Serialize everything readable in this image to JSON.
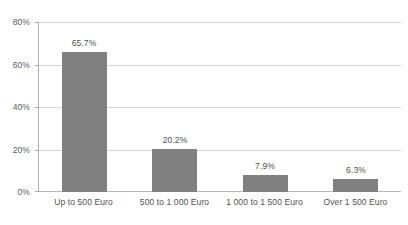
{
  "chart_data": {
    "type": "bar",
    "title": "",
    "xlabel": "",
    "ylabel": "",
    "categories": [
      "Up to 500 Euro",
      "500 to 1 000 Euro",
      "1 000 to 1 500 Euro",
      "Over 1 500 Euro"
    ],
    "values": [
      65.7,
      20.2,
      7.9,
      6.3
    ],
    "value_labels": [
      "65.7%",
      "20.2%",
      "7.9%",
      "6.3%"
    ],
    "ylim": [
      0,
      80
    ],
    "ytick_values": [
      0,
      20,
      40,
      60,
      80
    ],
    "ytick_labels": [
      "0%",
      "20%",
      "40%",
      "60%",
      "80%"
    ],
    "grid": true,
    "legend": false,
    "bar_color": "#808080",
    "gridline_color": "#d6d6d6",
    "axis_color": "#b0b0b0",
    "text_color": "#4f4f52"
  },
  "artifacts": {
    "top_clipped_text": ""
  }
}
